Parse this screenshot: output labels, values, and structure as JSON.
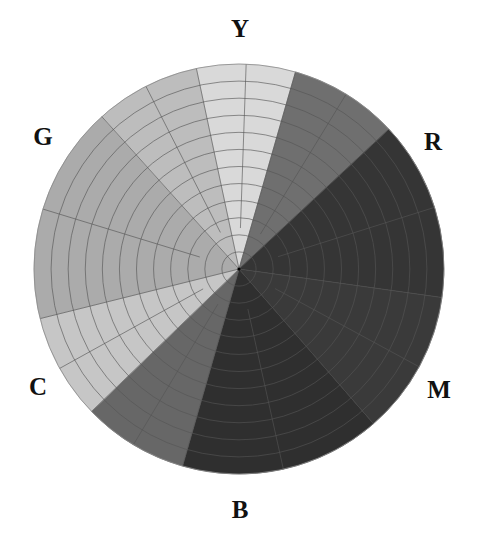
{
  "chart_data": {
    "type": "polar-grid-wheel",
    "title": "",
    "center": [
      239,
      269
    ],
    "radius": 205,
    "rings": 12,
    "spokes_per_sector": 2,
    "labels": [
      {
        "text": "Y",
        "x": 240,
        "y": 28
      },
      {
        "text": "R",
        "x": 433,
        "y": 141
      },
      {
        "text": "M",
        "x": 439,
        "y": 389
      },
      {
        "text": "B",
        "x": 240,
        "y": 509
      },
      {
        "text": "C",
        "x": 38,
        "y": 386
      },
      {
        "text": "G",
        "x": 43,
        "y": 136
      }
    ],
    "sectors": [
      {
        "name": "yellow",
        "start": -102,
        "end": -74,
        "color": "#d9d9d9"
      },
      {
        "name": "yellow-red",
        "start": -74,
        "end": -43,
        "color": "#6f6f6f"
      },
      {
        "name": "red",
        "start": -43,
        "end": 8,
        "color": "#353535"
      },
      {
        "name": "magenta",
        "start": 8,
        "end": 49,
        "color": "#3a3a3a"
      },
      {
        "name": "blue",
        "start": 49,
        "end": 106,
        "color": "#2f2f2f"
      },
      {
        "name": "blue-cyan",
        "start": 106,
        "end": 136,
        "color": "#676767"
      },
      {
        "name": "cyan",
        "start": 136,
        "end": 166,
        "color": "#c6c6c6"
      },
      {
        "name": "green",
        "start": 166,
        "end": 228,
        "color": "#ababab"
      },
      {
        "name": "green-yellow",
        "start": 228,
        "end": 258,
        "color": "#bdbdbd"
      }
    ],
    "grid_color": "#555555"
  }
}
